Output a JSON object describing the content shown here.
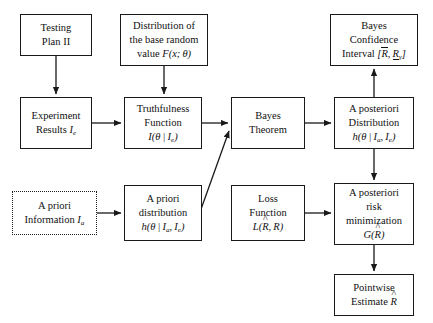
{
  "diagram": {
    "type": "flowchart",
    "canvas": {
      "width": 433,
      "height": 323
    },
    "style": {
      "background": "#ffffff",
      "line_color": "#1a1a1a",
      "text_color": "#111111"
    },
    "nodes": [
      {
        "id": "testing-plan",
        "name": "testing-plan-node",
        "border": "solid",
        "x": 20,
        "y": 14,
        "w": 72,
        "h": 42,
        "lines": [
          "Testing",
          "Plan II"
        ],
        "line1": "Testing",
        "line2": "Plan II"
      },
      {
        "id": "base-distribution",
        "name": "base-distribution-node",
        "border": "solid",
        "x": 120,
        "y": 14,
        "w": 88,
        "h": 52,
        "line1": "Distribution of",
        "line2": "the base random",
        "line3_prefix": "value ",
        "line3_math": "F(x; θ)"
      },
      {
        "id": "bayes-confidence-interval",
        "name": "bayes-confidence-interval-node",
        "border": "solid",
        "x": 330,
        "y": 14,
        "w": 88,
        "h": 52,
        "line1": "Bayes",
        "line2": "Confidence",
        "line3_prefix": "Interval ",
        "line3_math": "[R̄, R̲γ]"
      },
      {
        "id": "experiment-results",
        "name": "experiment-results-node",
        "border": "solid",
        "x": 20,
        "y": 97,
        "w": 72,
        "h": 52,
        "line1": "Experiment",
        "line2_prefix": "Results ",
        "line2_math": "I_e"
      },
      {
        "id": "truthfulness-function",
        "name": "truthfulness-function-node",
        "border": "solid",
        "x": 124,
        "y": 97,
        "w": 78,
        "h": 52,
        "line1": "Truthfulness",
        "line2": "Function",
        "line3_math": "I(θ | I_e)"
      },
      {
        "id": "bayes-theorem",
        "name": "bayes-theorem-node",
        "border": "solid",
        "x": 231,
        "y": 97,
        "w": 74,
        "h": 52,
        "line1": "Bayes",
        "line2": "Theorem"
      },
      {
        "id": "a-posteriori-distribution",
        "name": "a-posteriori-distribution-node",
        "border": "solid",
        "x": 334,
        "y": 97,
        "w": 80,
        "h": 52,
        "line1": "A posteriori",
        "line2": "Distribution",
        "line3_math": "h(θ | I_a, I_e)"
      },
      {
        "id": "a-priori-information",
        "name": "a-priori-information-node",
        "border": "dotted",
        "x": 12,
        "y": 191,
        "w": 85,
        "h": 44,
        "line1": "A priori",
        "line2_prefix": "Information ",
        "line2_math": "I_a"
      },
      {
        "id": "a-priori-distribution",
        "name": "a-priori-distribution-node",
        "border": "solid",
        "x": 124,
        "y": 185,
        "w": 78,
        "h": 56,
        "line1": "A priori",
        "line2": "distribution",
        "line3_math": "h(θ | I_a, I_e)"
      },
      {
        "id": "loss-function",
        "name": "loss-function-node",
        "border": "solid",
        "x": 231,
        "y": 185,
        "w": 74,
        "h": 56,
        "line1": "Loss",
        "line2": "Function",
        "line3_math": "L(R̂, R)"
      },
      {
        "id": "a-posteriori-risk",
        "name": "a-posteriori-risk-node",
        "border": "solid",
        "x": 334,
        "y": 183,
        "w": 80,
        "h": 62,
        "line1": "A posteriori",
        "line2": "risk",
        "line3": "minimization",
        "line4_math": "G(R̂)"
      },
      {
        "id": "pointwise-estimate",
        "name": "pointwise-estimate-node",
        "border": "solid",
        "x": 334,
        "y": 274,
        "w": 80,
        "h": 42,
        "line1": "Pointwise",
        "line2_prefix": "Estimate ",
        "line2_math": "R̂"
      }
    ],
    "edges": [
      {
        "id": "e1",
        "name": "edge-testing-plan-to-experiment-results",
        "from": "testing-plan",
        "to": "experiment-results",
        "kind": "vertical"
      },
      {
        "id": "e2",
        "name": "edge-base-distribution-to-truthfulness",
        "from": "base-distribution",
        "to": "truthfulness-function",
        "kind": "vertical"
      },
      {
        "id": "e3",
        "name": "edge-experiment-results-to-truthfulness",
        "from": "experiment-results",
        "to": "truthfulness-function",
        "kind": "horizontal"
      },
      {
        "id": "e4",
        "name": "edge-truthfulness-to-bayes-theorem",
        "from": "truthfulness-function",
        "to": "bayes-theorem",
        "kind": "horizontal"
      },
      {
        "id": "e5",
        "name": "edge-bayes-theorem-to-a-posteriori-distribution",
        "from": "bayes-theorem",
        "to": "a-posteriori-distribution",
        "kind": "horizontal"
      },
      {
        "id": "e6",
        "name": "edge-a-posteriori-distribution-to-confidence-interval",
        "from": "a-posteriori-distribution",
        "to": "bayes-confidence-interval",
        "kind": "vertical-up"
      },
      {
        "id": "e7",
        "name": "edge-a-priori-information-to-a-priori-distribution",
        "from": "a-priori-information",
        "to": "a-priori-distribution",
        "kind": "horizontal"
      },
      {
        "id": "e8",
        "name": "edge-a-priori-distribution-to-bayes-theorem",
        "from": "a-priori-distribution",
        "to": "bayes-theorem",
        "kind": "diagonal"
      },
      {
        "id": "e9",
        "name": "edge-loss-function-to-a-posteriori-risk",
        "from": "loss-function",
        "to": "a-posteriori-risk",
        "kind": "horizontal"
      },
      {
        "id": "e10",
        "name": "edge-a-posteriori-distribution-to-a-posteriori-risk",
        "from": "a-posteriori-distribution",
        "to": "a-posteriori-risk",
        "kind": "vertical"
      },
      {
        "id": "e11",
        "name": "edge-a-posteriori-risk-to-pointwise-estimate",
        "from": "a-posteriori-risk",
        "to": "pointwise-estimate",
        "kind": "vertical"
      }
    ]
  }
}
